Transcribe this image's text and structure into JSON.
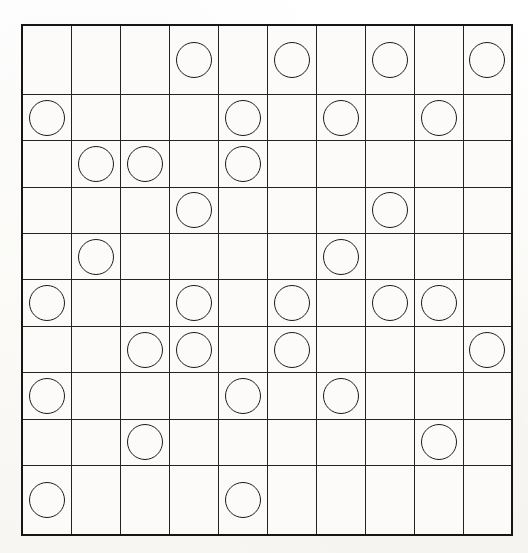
{
  "puzzle": {
    "title": "Circle Grid Puzzle",
    "grid_type": "square-lattice",
    "rows": 10,
    "columns": 10,
    "cell_width_px": 49,
    "cell_height_px": 51,
    "colors": {
      "page_background": "#fdfcfa",
      "grid_background": "#fcfbf9",
      "outer_border": "#161616",
      "inner_line": "#23231f",
      "stone_outline": "#1b1b18",
      "stone_fill": "none"
    },
    "stone_style": "open-circle",
    "stone_count": 33,
    "empty_count": 67
  },
  "chart_data": {
    "type": "heatmap",
    "xlabel": "",
    "ylabel": "",
    "legend": [
      {
        "key": 1,
        "label": "circle"
      },
      {
        "key": 0,
        "label": "empty"
      }
    ],
    "categories_x": [
      "1",
      "2",
      "3",
      "4",
      "5",
      "6",
      "7",
      "8",
      "9",
      "10"
    ],
    "categories_y": [
      "1",
      "2",
      "3",
      "4",
      "5",
      "6",
      "7",
      "8",
      "9",
      "10"
    ],
    "grid": [
      [
        0,
        0,
        0,
        1,
        0,
        1,
        0,
        1,
        0,
        1
      ],
      [
        1,
        0,
        0,
        0,
        1,
        0,
        1,
        0,
        1,
        0
      ],
      [
        0,
        1,
        1,
        0,
        1,
        0,
        0,
        0,
        0,
        0
      ],
      [
        0,
        0,
        0,
        1,
        0,
        0,
        0,
        1,
        0,
        0
      ],
      [
        0,
        1,
        0,
        0,
        0,
        0,
        1,
        0,
        0,
        0
      ],
      [
        1,
        0,
        0,
        1,
        0,
        1,
        0,
        1,
        1,
        0
      ],
      [
        0,
        0,
        1,
        1,
        0,
        1,
        0,
        0,
        0,
        1
      ],
      [
        1,
        0,
        0,
        0,
        1,
        0,
        1,
        0,
        0,
        0
      ],
      [
        0,
        0,
        1,
        0,
        0,
        0,
        0,
        0,
        1,
        0
      ],
      [
        1,
        0,
        0,
        0,
        1,
        0,
        0,
        0,
        0,
        0
      ]
    ],
    "row_counts": [
      4,
      4,
      3,
      2,
      2,
      5,
      4,
      3,
      2,
      2
    ],
    "column_counts": [
      4,
      2,
      2,
      3,
      3,
      3,
      3,
      3,
      3,
      2
    ],
    "circle_cells": [
      {
        "row": 1,
        "col": 4
      },
      {
        "row": 1,
        "col": 6
      },
      {
        "row": 1,
        "col": 8
      },
      {
        "row": 1,
        "col": 10
      },
      {
        "row": 2,
        "col": 1
      },
      {
        "row": 2,
        "col": 5
      },
      {
        "row": 2,
        "col": 7
      },
      {
        "row": 2,
        "col": 9
      },
      {
        "row": 3,
        "col": 2
      },
      {
        "row": 3,
        "col": 3
      },
      {
        "row": 3,
        "col": 5
      },
      {
        "row": 4,
        "col": 4
      },
      {
        "row": 4,
        "col": 8
      },
      {
        "row": 5,
        "col": 2
      },
      {
        "row": 5,
        "col": 7
      },
      {
        "row": 6,
        "col": 1
      },
      {
        "row": 6,
        "col": 4
      },
      {
        "row": 6,
        "col": 6
      },
      {
        "row": 6,
        "col": 8
      },
      {
        "row": 6,
        "col": 9
      },
      {
        "row": 7,
        "col": 3
      },
      {
        "row": 7,
        "col": 4
      },
      {
        "row": 7,
        "col": 6
      },
      {
        "row": 7,
        "col": 10
      },
      {
        "row": 8,
        "col": 1
      },
      {
        "row": 8,
        "col": 5
      },
      {
        "row": 8,
        "col": 7
      },
      {
        "row": 9,
        "col": 3
      },
      {
        "row": 9,
        "col": 9
      },
      {
        "row": 10,
        "col": 1
      },
      {
        "row": 10,
        "col": 5
      }
    ]
  }
}
